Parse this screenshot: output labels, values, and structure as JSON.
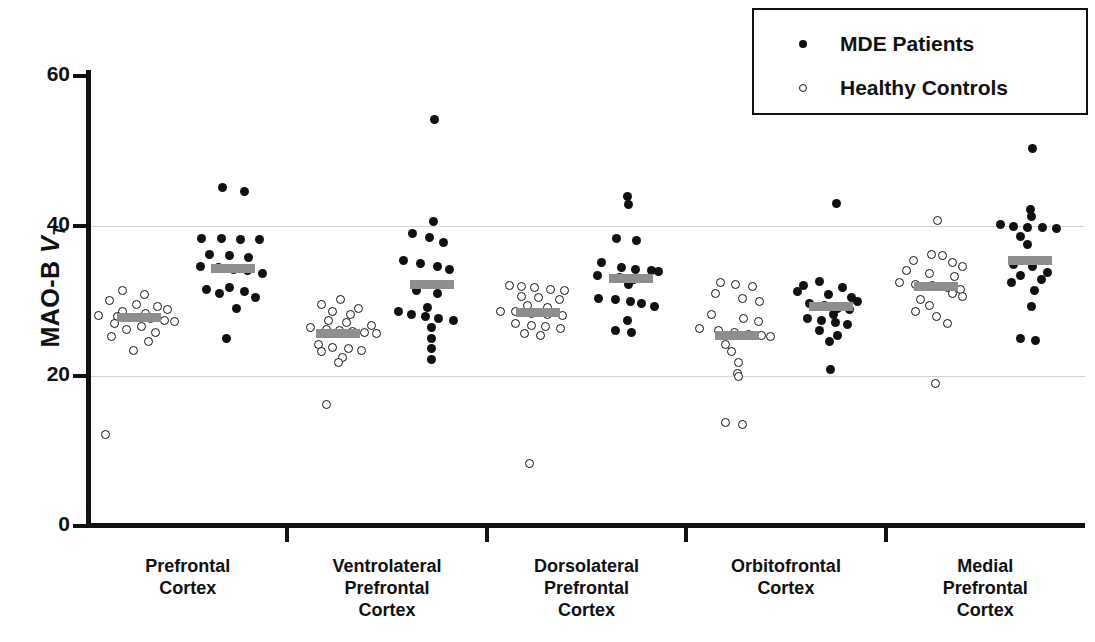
{
  "chart_data": {
    "type": "scatter",
    "title": "",
    "xlabel": "",
    "ylabel": "MAO-B VT",
    "ylabel_parts": {
      "prefix": "MAO-B ",
      "italic": "V",
      "subscript": "T"
    },
    "ylim": [
      0,
      60
    ],
    "yticks": [
      0,
      20,
      40,
      60
    ],
    "ytick_labels": [
      "0",
      "20",
      "40",
      "60"
    ],
    "gridlines": [
      20,
      40
    ],
    "grid": true,
    "legend_position": "top-right",
    "legend": [
      {
        "label": "MDE Patients",
        "marker": "filled-circle",
        "color": "#111111"
      },
      {
        "label": "Healthy Controls",
        "marker": "open-circle",
        "color": "#111111"
      }
    ],
    "categories": [
      "Prefrontal Cortex",
      "Ventrolateral Prefrontal Cortex",
      "Dorsolateral Prefrontal Cortex",
      "Orbitofrontal Cortex",
      "Medial Prefrontal Cortex"
    ],
    "category_lines": [
      [
        "Prefrontal",
        "Cortex"
      ],
      [
        "Ventrolateral",
        "Prefrontal",
        "Cortex"
      ],
      [
        "Dorsolateral",
        "Prefrontal",
        "Cortex"
      ],
      [
        "Orbitofrontal",
        "Cortex"
      ],
      [
        "Medial",
        "Prefrontal",
        "Cortex"
      ]
    ],
    "mean_marker": {
      "style": "horizontal-bar",
      "color": "#8e8e8e"
    },
    "groups": [
      {
        "category": "Prefrontal Cortex",
        "series": [
          {
            "name": "Healthy Controls",
            "mean": 27.7,
            "values": [
              31.4,
              30.8,
              30.0,
              29.5,
              29.2,
              28.8,
              28.5,
              28.3,
              28.0,
              27.9,
              27.7,
              27.6,
              27.4,
              27.2,
              26.9,
              26.6,
              26.2,
              25.8,
              25.2,
              24.6,
              23.3,
              12.2
            ],
            "offsets": [
              -0.3,
              0.1,
              -0.55,
              -0.05,
              0.35,
              0.52,
              -0.3,
              0.12,
              -0.75,
              -0.4,
              -0.08,
              0.22,
              0.48,
              0.66,
              -0.45,
              0.05,
              -0.22,
              0.3,
              -0.5,
              0.18,
              -0.1,
              -0.62
            ]
          },
          {
            "name": "MDE Patients",
            "mean": 34.3,
            "values": [
              45.1,
              44.6,
              38.3,
              38.3,
              38.2,
              38.1,
              36.1,
              36.0,
              35.8,
              34.6,
              34.4,
              34.2,
              34.0,
              33.6,
              31.8,
              31.5,
              31.2,
              30.9,
              30.4,
              29.0,
              24.9
            ],
            "offsets": [
              -0.18,
              0.22,
              -0.58,
              -0.2,
              0.15,
              0.5,
              -0.42,
              -0.05,
              0.3,
              -0.6,
              -0.26,
              0.02,
              0.28,
              0.56,
              -0.05,
              -0.48,
              0.22,
              -0.25,
              0.42,
              0.08,
              -0.12
            ]
          }
        ]
      },
      {
        "category": "Ventrolateral Prefrontal Cortex",
        "series": [
          {
            "name": "Healthy Controls",
            "mean": 25.6,
            "values": [
              30.2,
              29.5,
              29.0,
              28.5,
              28.1,
              27.4,
              27.1,
              26.7,
              26.4,
              26.2,
              26.0,
              25.9,
              25.7,
              25.6,
              24.2,
              23.8,
              23.6,
              23.4,
              23.2,
              22.4,
              21.8,
              16.2
            ],
            "offsets": [
              0.05,
              -0.3,
              0.38,
              -0.1,
              0.22,
              -0.18,
              0.15,
              0.62,
              -0.52,
              -0.22,
              0.02,
              0.26,
              0.48,
              0.7,
              -0.36,
              -0.1,
              0.18,
              0.42,
              -0.3,
              0.08,
              0.0,
              -0.22
            ]
          },
          {
            "name": "MDE Patients",
            "mean": 32.1,
            "values": [
              54.2,
              40.6,
              39.0,
              38.4,
              37.8,
              35.3,
              34.9,
              34.5,
              34.2,
              32.2,
              31.3,
              31.0,
              29.1,
              28.5,
              28.2,
              27.9,
              27.6,
              27.3,
              26.4,
              24.9,
              23.6,
              22.2
            ],
            "offsets": [
              0.05,
              0.02,
              -0.35,
              -0.05,
              0.22,
              -0.52,
              -0.22,
              0.1,
              0.32,
              -0.15,
              -0.28,
              0.1,
              -0.08,
              -0.62,
              -0.38,
              -0.12,
              0.12,
              0.4,
              0.0,
              0.0,
              0.0,
              0.0
            ]
          }
        ]
      },
      {
        "category": "Dorsolateral Prefrontal Cortex",
        "series": [
          {
            "name": "Healthy Controls",
            "mean": 28.4,
            "values": [
              32.0,
              31.9,
              31.8,
              31.5,
              31.4,
              30.6,
              30.4,
              30.2,
              29.4,
              29.1,
              28.6,
              28.5,
              28.3,
              28.2,
              28.0,
              26.9,
              26.7,
              26.5,
              26.3,
              25.6,
              25.4,
              8.3
            ],
            "offsets": [
              -0.52,
              -0.3,
              -0.05,
              0.24,
              0.5,
              -0.3,
              0.02,
              0.4,
              -0.18,
              0.18,
              -0.68,
              -0.4,
              -0.12,
              0.18,
              0.46,
              -0.4,
              -0.12,
              0.14,
              0.42,
              -0.25,
              0.05,
              -0.15
            ]
          },
          {
            "name": "MDE Patients",
            "mean": 32.9,
            "values": [
              43.9,
              42.8,
              38.3,
              38.0,
              35.1,
              34.4,
              34.2,
              34.0,
              33.9,
              33.4,
              33.1,
              32.8,
              32.2,
              30.3,
              30.1,
              29.9,
              29.6,
              29.2,
              27.3,
              26.0,
              25.8
            ],
            "offsets": [
              -0.08,
              -0.05,
              -0.28,
              0.1,
              -0.55,
              -0.18,
              0.08,
              0.38,
              0.5,
              -0.62,
              -0.22,
              0.04,
              -0.05,
              -0.6,
              -0.3,
              -0.02,
              0.18,
              0.42,
              -0.08,
              -0.3,
              0.0
            ]
          }
        ]
      },
      {
        "category": "Orbitofrontal Cortex",
        "series": [
          {
            "name": "Healthy Controls",
            "mean": 25.4,
            "values": [
              32.4,
              32.2,
              31.9,
              30.9,
              30.3,
              29.9,
              28.1,
              27.6,
              27.2,
              26.3,
              26.0,
              25.7,
              25.5,
              25.4,
              25.2,
              24.1,
              23.2,
              21.7,
              20.3,
              19.9,
              13.7,
              13.5
            ],
            "offsets": [
              -0.3,
              -0.02,
              0.28,
              -0.4,
              0.1,
              0.42,
              -0.48,
              0.12,
              0.4,
              -0.7,
              -0.35,
              -0.05,
              0.22,
              0.45,
              0.62,
              -0.22,
              -0.1,
              0.02,
              0.0,
              0.02,
              -0.22,
              0.1
            ]
          },
          {
            "name": "MDE Patients",
            "mean": 29.2,
            "values": [
              42.9,
              32.5,
              32.0,
              31.8,
              31.2,
              30.8,
              30.4,
              29.9,
              29.6,
              29.3,
              29.0,
              28.8,
              28.2,
              27.6,
              27.3,
              27.1,
              26.8,
              26.0,
              25.3,
              24.5,
              20.8
            ],
            "offsets": [
              0.1,
              -0.2,
              -0.5,
              0.22,
              -0.62,
              -0.05,
              0.38,
              0.5,
              -0.4,
              -0.12,
              0.12,
              0.34,
              0.05,
              -0.42,
              -0.18,
              0.08,
              0.3,
              -0.2,
              0.12,
              -0.02,
              0.0
            ]
          }
        ]
      },
      {
        "category": "Medial Prefrontal Cortex",
        "series": [
          {
            "name": "Healthy Controls",
            "mean": 31.9,
            "values": [
              40.7,
              36.2,
              36.0,
              35.4,
              35.1,
              34.6,
              34.0,
              33.6,
              33.2,
              32.4,
              32.2,
              32.0,
              31.8,
              31.5,
              31.0,
              30.6,
              30.2,
              29.4,
              28.6,
              27.9,
              27.0,
              19.0
            ],
            "offsets": [
              0.02,
              -0.1,
              0.12,
              -0.42,
              0.3,
              0.48,
              -0.55,
              -0.12,
              0.34,
              -0.68,
              -0.38,
              -0.08,
              0.2,
              0.44,
              0.3,
              0.48,
              -0.3,
              -0.12,
              -0.38,
              0.0,
              0.2,
              -0.02
            ]
          },
          {
            "name": "MDE Patients",
            "mean": 35.3,
            "values": [
              50.3,
              42.2,
              41.2,
              40.1,
              39.9,
              39.8,
              39.7,
              39.6,
              38.6,
              37.5,
              34.8,
              34.5,
              33.7,
              33.3,
              32.8,
              32.4,
              31.4,
              29.2,
              25.0,
              24.7
            ],
            "offsets": [
              0.05,
              0.0,
              0.02,
              -0.55,
              -0.3,
              -0.05,
              0.22,
              0.48,
              -0.18,
              -0.05,
              -0.3,
              0.05,
              0.32,
              -0.18,
              0.2,
              -0.35,
              0.08,
              0.02,
              -0.18,
              0.1
            ]
          }
        ]
      }
    ]
  },
  "axis": {
    "y_title_prefix": "MAO-B ",
    "y_title_italic": "V",
    "y_title_sub": "T",
    "ytick_0": "0",
    "ytick_20": "20",
    "ytick_40": "40",
    "ytick_60": "60"
  },
  "legend": {
    "mde_label": "MDE Patients",
    "hc_label": "Healthy Controls"
  },
  "categories": {
    "c0_l0": "Prefrontal",
    "c0_l1": "Cortex",
    "c0_l2": "",
    "c1_l0": "Ventrolateral",
    "c1_l1": "Prefrontal",
    "c1_l2": "Cortex",
    "c2_l0": "Dorsolateral",
    "c2_l1": "Prefrontal",
    "c2_l2": "Cortex",
    "c3_l0": "Orbitofrontal",
    "c3_l1": "Cortex",
    "c3_l2": "",
    "c4_l0": "Medial",
    "c4_l1": "Prefrontal",
    "c4_l2": "Cortex"
  },
  "colors": {
    "mde": "#111111",
    "hc_stroke": "#111111",
    "mean_bar": "#8e8e8e",
    "axis": "#111111",
    "grid": "#d2d2d2",
    "background": "#ffffff"
  }
}
